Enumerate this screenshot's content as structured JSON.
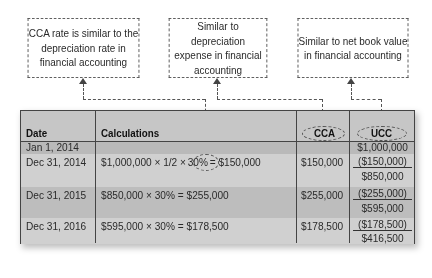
{
  "callouts": [
    {
      "lines": [
        "CCA rate is similar to the",
        "depreciation rate in",
        "financial accounting"
      ]
    },
    {
      "lines": [
        "Similar to depreciation",
        "expense in financial",
        "accounting"
      ]
    },
    {
      "lines": [
        "Similar to net book value",
        "in financial accounting"
      ]
    }
  ],
  "table": {
    "headers": {
      "date": "Date",
      "calculations": "Calculations",
      "cca": "CCA",
      "ucc": "UCC"
    },
    "rows": [
      {
        "date": "Jan 1, 2014",
        "calculation": "",
        "cca": "",
        "ucc": [
          "$1,000,000"
        ]
      },
      {
        "date": "Dec 31, 2014",
        "calculation_pre": "$1,000,000 × 1/2 ×",
        "calculation_rate": "30%",
        "calculation_post": "= $150,000",
        "cca": "$150,000",
        "ucc": [
          "($150,000)",
          "$850,000"
        ]
      },
      {
        "date": "Dec 31, 2015",
        "calculation": "$850,000 × 30% = $255,000",
        "cca": "$255,000",
        "ucc": [
          "($255,000)",
          "$595,000"
        ]
      },
      {
        "date": "Dec 31, 2016",
        "calculation": "$595,000 × 30% = $178,500",
        "cca": "$178,500",
        "ucc": [
          "($178,500)",
          "$416,500"
        ]
      }
    ]
  },
  "colors": {
    "table_bg": "#c9c9c9",
    "band_light": "#d3d3d3",
    "band_dark": "#bcbcbc",
    "line": "#444444"
  }
}
